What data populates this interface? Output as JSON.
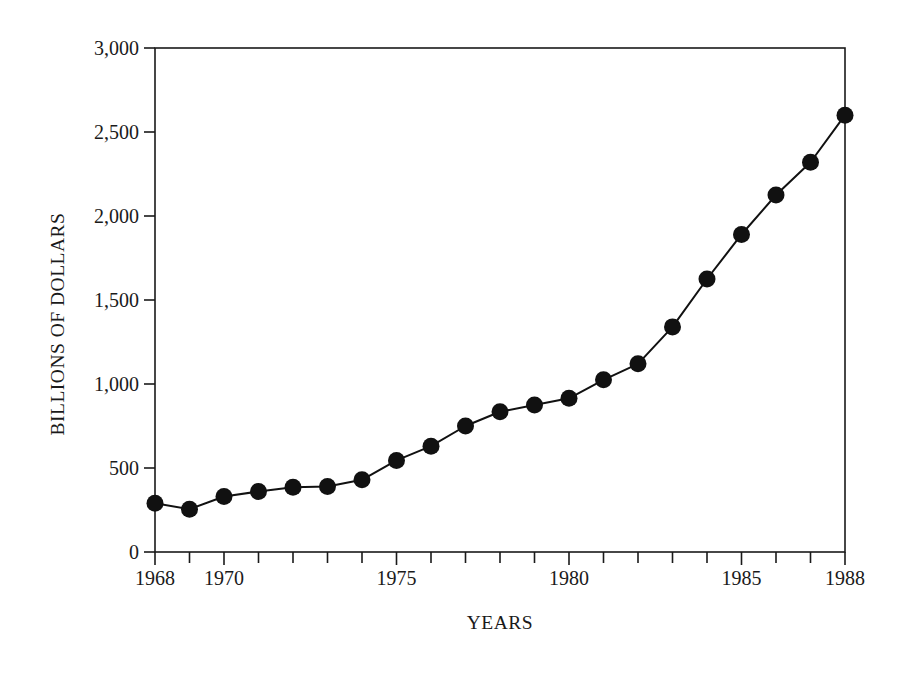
{
  "chart_data": {
    "type": "line",
    "title": "",
    "xlabel": "YEARS",
    "ylabel": "BILLIONS OF DOLLARS",
    "xlim": [
      1968,
      1988
    ],
    "ylim": [
      0,
      3000
    ],
    "grid": false,
    "legend": null,
    "marker": "filled-circle",
    "x_tick_labels": [
      "1968",
      "1970",
      "1975",
      "1980",
      "1985",
      "1988"
    ],
    "x_tick_label_values": [
      1968,
      1970,
      1975,
      1980,
      1985,
      1988
    ],
    "x_minor_ticks_every": 1,
    "y_tick_labels": [
      "0",
      "500",
      "1,000",
      "1,500",
      "2,000",
      "2,500",
      "3,000"
    ],
    "y_tick_values": [
      0,
      500,
      1000,
      1500,
      2000,
      2500,
      3000
    ],
    "x": [
      1968,
      1969,
      1970,
      1971,
      1972,
      1973,
      1974,
      1975,
      1976,
      1977,
      1978,
      1979,
      1980,
      1981,
      1982,
      1983,
      1984,
      1985,
      1986,
      1987,
      1988
    ],
    "values": [
      290,
      255,
      330,
      360,
      385,
      390,
      430,
      545,
      630,
      750,
      835,
      875,
      915,
      1025,
      1120,
      1340,
      1625,
      1890,
      2125,
      2320,
      2600
    ],
    "series": [
      {
        "name": "BILLIONS OF DOLLARS",
        "color": "#111111",
        "values": [
          290,
          255,
          330,
          360,
          385,
          390,
          430,
          545,
          630,
          750,
          835,
          875,
          915,
          1025,
          1120,
          1340,
          1625,
          1890,
          2125,
          2320,
          2600
        ]
      }
    ]
  },
  "style": {
    "line_color": "#111111",
    "marker_color": "#111111",
    "axis_color": "#1a1a1a",
    "background": "#ffffff"
  }
}
